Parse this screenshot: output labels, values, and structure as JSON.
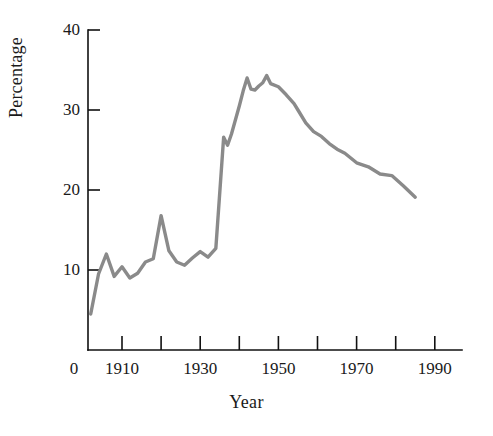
{
  "chart_data": {
    "type": "line",
    "title": "",
    "subtitle": "",
    "xlabel": "Year",
    "ylabel": "Percentage",
    "xlim": [
      1895,
      1995
    ],
    "ylim": [
      0,
      40
    ],
    "grid": false,
    "legend": null,
    "line_color": "#8a8a8a",
    "axis_color": "#111111",
    "x_ticks": [
      {
        "value": 0,
        "label": "0"
      },
      {
        "value": 1910,
        "label": "1910"
      },
      {
        "value": 1920,
        "label": ""
      },
      {
        "value": 1930,
        "label": "1930"
      },
      {
        "value": 1940,
        "label": ""
      },
      {
        "value": 1950,
        "label": "1950"
      },
      {
        "value": 1960,
        "label": ""
      },
      {
        "value": 1970,
        "label": "1970"
      },
      {
        "value": 1980,
        "label": ""
      },
      {
        "value": 1990,
        "label": "1990"
      }
    ],
    "y_ticks": [
      {
        "value": 0,
        "label": ""
      },
      {
        "value": 10,
        "label": "10"
      },
      {
        "value": 20,
        "label": "20"
      },
      {
        "value": 30,
        "label": "30"
      },
      {
        "value": 40,
        "label": "40"
      }
    ],
    "x": [
      1902,
      1904,
      1906,
      1908,
      1910,
      1912,
      1914,
      1916,
      1918,
      1920,
      1922,
      1924,
      1926,
      1928,
      1930,
      1932,
      1934,
      1936,
      1937,
      1938,
      1940,
      1941,
      1942,
      1943,
      1944,
      1945,
      1946,
      1947,
      1948,
      1950,
      1952,
      1954,
      1955,
      1957,
      1959,
      1961,
      1963,
      1965,
      1967,
      1970,
      1973,
      1976,
      1979,
      1982,
      1985
    ],
    "values": [
      4.5,
      9.5,
      12.0,
      9.2,
      10.4,
      9.0,
      9.6,
      11.0,
      11.4,
      16.8,
      12.4,
      11.0,
      10.6,
      11.5,
      12.3,
      11.6,
      12.7,
      26.6,
      25.6,
      27.0,
      30.5,
      32.4,
      34.0,
      32.6,
      32.5,
      33.0,
      33.4,
      34.3,
      33.3,
      32.9,
      31.9,
      30.8,
      30.0,
      28.4,
      27.3,
      26.7,
      25.8,
      25.1,
      24.6,
      23.4,
      22.9,
      22.0,
      21.8,
      20.5,
      19.1
    ],
    "annotations": []
  },
  "axis": {
    "y_title": "Percentage",
    "x_title": "Year"
  }
}
